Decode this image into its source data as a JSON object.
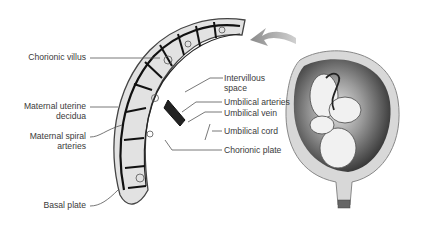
{
  "diagram": {
    "type": "anatomical-illustration",
    "labels_left": [
      {
        "id": "chorionic-villus",
        "text": "Chorionic villus"
      },
      {
        "id": "maternal-uterine-decidua",
        "line1": "Maternal uterine",
        "line2": "decidua"
      },
      {
        "id": "maternal-spiral-arteries",
        "line1": "Maternal spiral",
        "line2": "arteries"
      },
      {
        "id": "basal-plate",
        "text": "Basal plate"
      }
    ],
    "labels_right": [
      {
        "id": "intervillous-space",
        "line1": "Intervillous",
        "line2": "space"
      },
      {
        "id": "umbilical-arteries",
        "text": "Umbilical arteries"
      },
      {
        "id": "umbilical-vein",
        "text": "Umbilical vein"
      },
      {
        "id": "umbilical-cord",
        "text": "Umbilical cord"
      },
      {
        "id": "chorionic-plate",
        "text": "Chorionic plate"
      }
    ],
    "arrow": {
      "direction": "from uterus toward placenta detail",
      "color": "#8a8a8a"
    },
    "colors": {
      "text": "#3a3a3a",
      "leader": "#555555",
      "uterus_dark": "#2e2e2e",
      "uterus_wall": "#d8d8d8",
      "placenta_fill": "#e2e2e2",
      "villus_dark": "#111111"
    }
  }
}
